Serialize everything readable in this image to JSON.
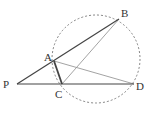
{
  "diagram": {
    "type": "geometry",
    "colors": {
      "background": "#ffffff",
      "circle": "#777777",
      "dark_line": "#444444",
      "light_line": "#999999",
      "label": "#333333"
    },
    "circle": {
      "cx": 96,
      "cy": 59,
      "r": 44,
      "style": "dashed"
    },
    "points": {
      "P": {
        "x": 17,
        "y": 84,
        "label": "P",
        "lx": 3,
        "ly": 88
      },
      "A": {
        "x": 54,
        "y": 61,
        "label": "A",
        "lx": 44,
        "ly": 61
      },
      "B": {
        "x": 119,
        "y": 19,
        "label": "B",
        "lx": 121,
        "ly": 17
      },
      "C": {
        "x": 62,
        "y": 84,
        "label": "C",
        "lx": 55,
        "ly": 98
      },
      "D": {
        "x": 134,
        "y": 84,
        "label": "D",
        "lx": 136,
        "ly": 90
      }
    },
    "segments": [
      {
        "from": "P",
        "to": "B",
        "style": "dark"
      },
      {
        "from": "P",
        "to": "D",
        "style": "dark"
      },
      {
        "from": "A",
        "to": "C",
        "style": "dark-thick"
      },
      {
        "from": "A",
        "to": "D",
        "style": "light"
      },
      {
        "from": "C",
        "to": "B",
        "style": "light"
      }
    ]
  }
}
